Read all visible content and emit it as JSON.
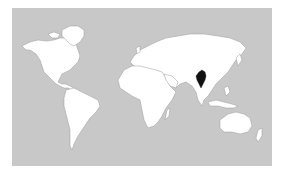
{
  "map": {
    "type": "world-locator-map",
    "highlighted_country": "Myanmar",
    "colors": {
      "ocean": "#c8c8c8",
      "land": "#ffffff",
      "border": "#9a9a9a",
      "highlight": "#111111",
      "page_background": "#ffffff"
    }
  }
}
